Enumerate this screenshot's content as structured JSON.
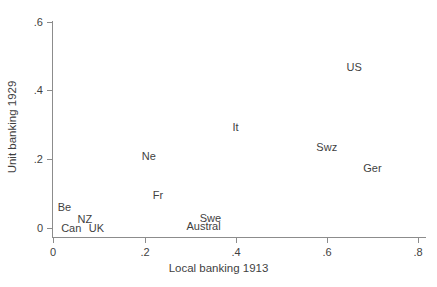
{
  "chart_data": {
    "type": "scatter",
    "title": "",
    "xlabel": "Local banking 1913",
    "ylabel": "Unit banking 1929",
    "xlim": [
      0,
      0.8
    ],
    "ylim": [
      0,
      0.6
    ],
    "xticks": [
      "0",
      ".2",
      ".4",
      ".6",
      ".8"
    ],
    "xtick_values": [
      0,
      0.2,
      0.4,
      0.6,
      0.8
    ],
    "yticks": [
      "0",
      ".2",
      ".4",
      ".6"
    ],
    "ytick_values": [
      0,
      0.2,
      0.4,
      0.6
    ],
    "grid": false,
    "legend": false,
    "marker_style": "text-label-only",
    "points": [
      {
        "label": "US",
        "x": 0.66,
        "y": 0.47
      },
      {
        "label": "Swz",
        "x": 0.6,
        "y": 0.235
      },
      {
        "label": "Ger",
        "x": 0.7,
        "y": 0.175
      },
      {
        "label": "It",
        "x": 0.4,
        "y": 0.295
      },
      {
        "label": "Ne",
        "x": 0.21,
        "y": 0.21
      },
      {
        "label": "Fr",
        "x": 0.23,
        "y": 0.095
      },
      {
        "label": "Swe",
        "x": 0.345,
        "y": 0.03
      },
      {
        "label": "Austral",
        "x": 0.33,
        "y": 0.005
      },
      {
        "label": "Be",
        "x": 0.025,
        "y": 0.06
      },
      {
        "label": "NZ",
        "x": 0.07,
        "y": 0.025
      },
      {
        "label": "Can",
        "x": 0.04,
        "y": 0.0
      },
      {
        "label": "UK",
        "x": 0.095,
        "y": 0.0
      }
    ]
  },
  "axes": {
    "x_title": "Local banking 1913",
    "y_title": "Unit banking 1929",
    "x_tick_labels": [
      "0",
      ".2",
      ".4",
      ".6",
      ".8"
    ],
    "y_tick_labels": [
      "0",
      ".2",
      ".4",
      ".6"
    ]
  },
  "colors": {
    "background": "#ffffff",
    "axis": "#8c8c8c",
    "text": "#3f3f3f"
  }
}
